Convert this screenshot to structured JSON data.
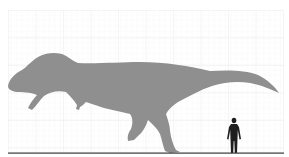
{
  "figure": {
    "colors": {
      "background": "#ffffff",
      "grid": "#ececec",
      "dinosaur": "#8f8f8f",
      "human": "#1e1e1e",
      "ground": "#3a3a3a"
    },
    "grid": {
      "x0": 8,
      "x1": 284,
      "y0": 10,
      "y1": 153,
      "minor_step": 5.5,
      "major_step": 27.5
    },
    "ground_y": 153,
    "subjects": [
      {
        "name": "theropod dinosaur",
        "color_key": "dinosaur"
      },
      {
        "name": "human",
        "color_key": "human"
      }
    ]
  }
}
